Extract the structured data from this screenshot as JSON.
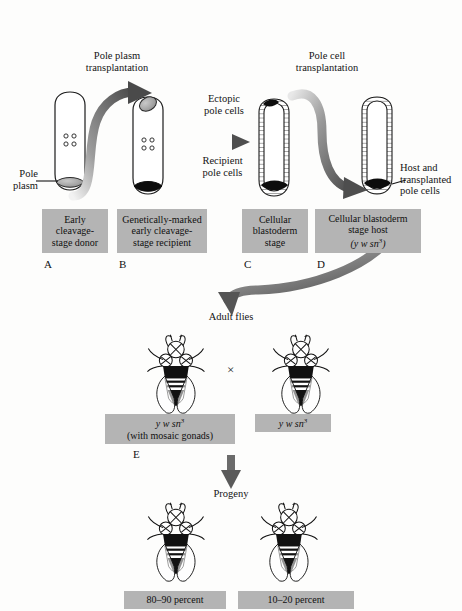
{
  "figure": {
    "background_color": "#fdfdfc",
    "box_color": "#b4b4b4",
    "ink_color": "#141414"
  },
  "headings": {
    "pole_plasm_transplantation": "Pole plasm\ntransplantation",
    "pole_cell_transplantation": "Pole cell\ntransplantation"
  },
  "callouts": {
    "pole_plasm": "Pole\nplasm",
    "ectopic_pole_cells": "Ectopic\npole cells",
    "recipient_pole_cells": "Recipient\npole cells",
    "host_and_transplanted": "Host and\ntransplanted\npole cells"
  },
  "stage_boxes": [
    {
      "letter": "A",
      "text": "Early\ncleavage-\nstage donor"
    },
    {
      "letter": "B",
      "text": "Genetically-marked\nearly cleavage-\nstage recipient"
    },
    {
      "letter": "C",
      "text": "Cellular\nblastoderm\nstage"
    },
    {
      "letter": "D",
      "text": "Cellular blastoderm\nstage host",
      "genotype_prefix": "(",
      "genotype": "y w sn",
      "genotype_sup": "3",
      "genotype_suffix": ")"
    }
  ],
  "flow": {
    "adult_flies": "Adult flies",
    "progeny": "Progeny",
    "cross_symbol": "×"
  },
  "cross_boxes": [
    {
      "letter": "E",
      "genotype": "y w sn",
      "genotype_sup": "3",
      "note": "(with mosaic gonads)"
    },
    {
      "letter": "",
      "genotype": "y w sn",
      "genotype_sup": "3",
      "note": ""
    }
  ],
  "progeny_boxes": [
    {
      "label": "80–90 percent"
    },
    {
      "label": "10–20 percent"
    }
  ],
  "embryos": [
    {
      "name": "donor-embryo",
      "stage": "early cleavage",
      "pole_plasm_fill": "#9a9a9a",
      "nuclei": 4
    },
    {
      "name": "recipient-embryo",
      "stage": "early cleavage",
      "ectopic_fill": "#9a9a9a",
      "pole_plasm_fill": "#0d0d0d",
      "nuclei": 4
    },
    {
      "name": "blastoderm-embryo",
      "stage": "cellular blastoderm",
      "ectopic_fill": "#0d0d0d",
      "pole_cells_fill": "#0d0d0d"
    },
    {
      "name": "host-blastoderm-embryo",
      "stage": "cellular blastoderm host",
      "pole_cells_fill": "#0d0d0d"
    }
  ],
  "flies": [
    {
      "name": "mosaic-gonad-fly"
    },
    {
      "name": "tester-fly"
    },
    {
      "name": "progeny-fly-majority"
    },
    {
      "name": "progeny-fly-minority"
    }
  ]
}
